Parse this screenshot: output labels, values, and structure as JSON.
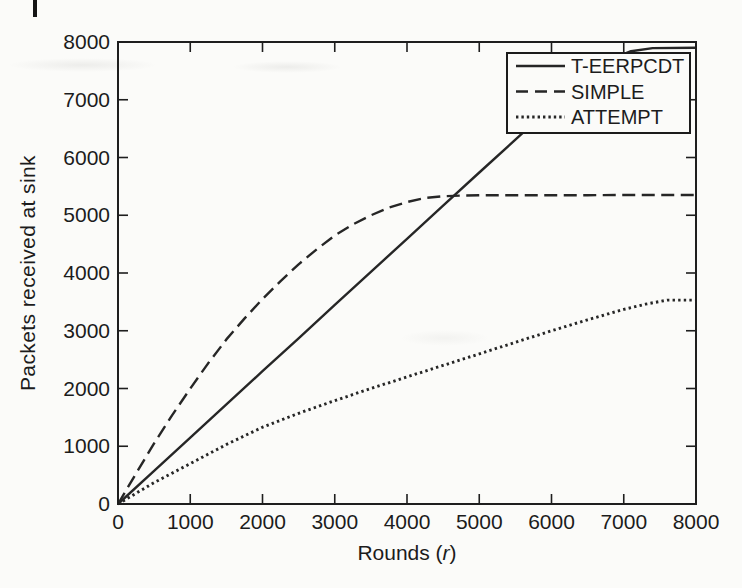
{
  "page": {
    "background_color": "#fbfbf9",
    "ink_color": "#262626",
    "page_edge_mark": "vertical-bar"
  },
  "chart_data": {
    "type": "line",
    "title": "",
    "xlabel": "Rounds (r)",
    "xlabel_parts": {
      "prefix": "Rounds (",
      "italic_var": "r",
      "suffix": ")"
    },
    "ylabel": "Packets received at sink",
    "xlim": [
      0,
      8000
    ],
    "ylim": [
      0,
      8000
    ],
    "x_ticks": [
      0,
      1000,
      2000,
      3000,
      4000,
      5000,
      6000,
      7000,
      8000
    ],
    "y_ticks": [
      0,
      1000,
      2000,
      3000,
      4000,
      5000,
      6000,
      7000,
      8000
    ],
    "grid": false,
    "legend_position": "top-right",
    "line_color": "#262626",
    "series": [
      {
        "name": "T-EERPCDT",
        "style": "solid",
        "points": [
          [
            0,
            0
          ],
          [
            500,
            575
          ],
          [
            1000,
            1150
          ],
          [
            1500,
            1725
          ],
          [
            2000,
            2300
          ],
          [
            2500,
            2870
          ],
          [
            3000,
            3450
          ],
          [
            3500,
            4020
          ],
          [
            4000,
            4590
          ],
          [
            4500,
            5165
          ],
          [
            5000,
            5740
          ],
          [
            5500,
            6310
          ],
          [
            6000,
            6880
          ],
          [
            6400,
            7330
          ],
          [
            6800,
            7690
          ],
          [
            7100,
            7840
          ],
          [
            7400,
            7895
          ],
          [
            8000,
            7900
          ]
        ]
      },
      {
        "name": "SIMPLE",
        "style": "dashed",
        "points": [
          [
            0,
            0
          ],
          [
            250,
            530
          ],
          [
            500,
            1050
          ],
          [
            750,
            1540
          ],
          [
            1000,
            2000
          ],
          [
            1250,
            2440
          ],
          [
            1500,
            2850
          ],
          [
            1750,
            3210
          ],
          [
            2000,
            3550
          ],
          [
            2250,
            3860
          ],
          [
            2500,
            4150
          ],
          [
            2750,
            4410
          ],
          [
            3000,
            4650
          ],
          [
            3250,
            4840
          ],
          [
            3500,
            5000
          ],
          [
            3750,
            5130
          ],
          [
            4000,
            5230
          ],
          [
            4250,
            5300
          ],
          [
            4500,
            5330
          ],
          [
            4750,
            5340
          ],
          [
            5000,
            5345
          ],
          [
            5500,
            5345
          ],
          [
            6000,
            5345
          ],
          [
            6500,
            5348
          ],
          [
            7000,
            5350
          ],
          [
            7500,
            5350
          ],
          [
            8000,
            5350
          ]
        ]
      },
      {
        "name": "ATTEMPT",
        "style": "dotted",
        "points": [
          [
            0,
            0
          ],
          [
            500,
            370
          ],
          [
            1000,
            700
          ],
          [
            1500,
            1030
          ],
          [
            2000,
            1330
          ],
          [
            2500,
            1570
          ],
          [
            3000,
            1790
          ],
          [
            3500,
            2000
          ],
          [
            4000,
            2200
          ],
          [
            4500,
            2400
          ],
          [
            5000,
            2600
          ],
          [
            5500,
            2800
          ],
          [
            6000,
            3000
          ],
          [
            6500,
            3190
          ],
          [
            7000,
            3370
          ],
          [
            7300,
            3460
          ],
          [
            7600,
            3530
          ],
          [
            8000,
            3530
          ]
        ]
      }
    ]
  }
}
